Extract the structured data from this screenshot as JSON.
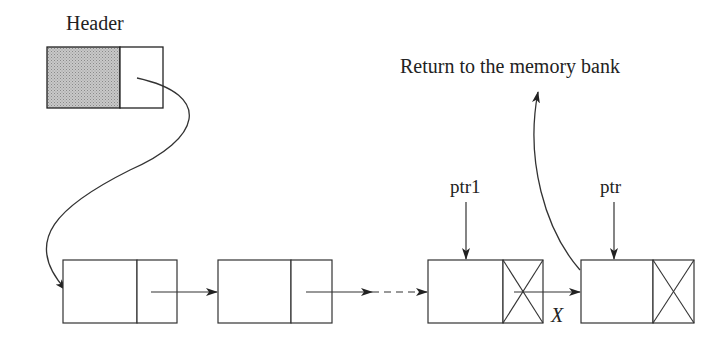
{
  "diagram": {
    "header_label": "Header",
    "return_label": "Return to the memory bank",
    "ptr1_label": "ptr1",
    "ptr_label": "ptr",
    "cut_label": "X",
    "nodes": [
      {
        "id": "header",
        "shaded": true
      },
      {
        "id": "node-1",
        "null_link": false
      },
      {
        "id": "node-2",
        "null_link": false
      },
      {
        "id": "node-ptr1",
        "null_link": true
      },
      {
        "id": "node-ptr",
        "null_link": true
      }
    ],
    "colors": {
      "stroke": "#222222",
      "shade": "#b8b8b8"
    }
  }
}
